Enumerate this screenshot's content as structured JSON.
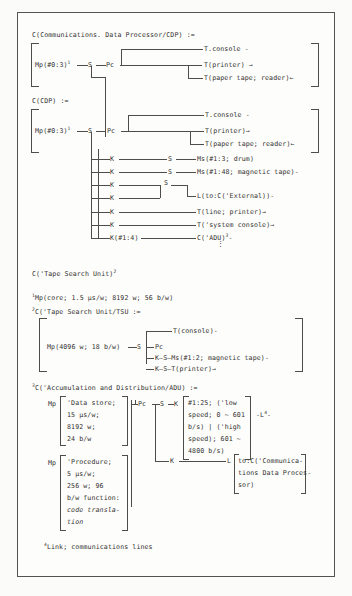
{
  "document": {
    "kind": "pms-notation-diagram",
    "ink_color": "#333130",
    "rule_color": "#4f4d49",
    "frame_color": "#55534e",
    "paper_color": "#fdfdfb"
  },
  "section_cdp": {
    "heading": "C(Communications. Data Processor/CDP) :=",
    "mp": "Mp(#0:3)",
    "mp_sup": "1",
    "s": "S",
    "pc": "Pc",
    "out_console": "T.console -",
    "out_printer": "T(printer) →",
    "out_paper_tape": "T(paper tape; reader)←"
  },
  "section_cdp2": {
    "heading": "C(CDP) :=",
    "mp": "Mp(#0:3)",
    "mp_sup": "1",
    "s": "S",
    "pc": "Pc",
    "out_console": "T.console -",
    "out_printer": "T(printer)→",
    "out_paper_tape": "T(paper tape; reader)←",
    "branches": [
      {
        "k": "K",
        "s": "S",
        "target": "Ms(#1:3; drum)"
      },
      {
        "k": "K",
        "s": "S",
        "target": "Ms(#1:48; magnetic tape)-"
      },
      {
        "k": "K",
        "s": "S",
        "target": ""
      },
      {
        "k": "K",
        "s": "",
        "target": "L(to:C('External))-"
      },
      {
        "k": "K",
        "s": "",
        "target": "T(line; printer)→"
      },
      {
        "k": "K",
        "s": "",
        "target": "T('system console)→"
      }
    ],
    "last_branch": {
      "k": "K(#1:4)",
      "target": "C('ADU)",
      "target_sup": "3"
    },
    "ellipsis": "⋮"
  },
  "tape_search_unit_ref": {
    "text": "C('Tape Search Unit)",
    "sup": "2"
  },
  "footnote1": {
    "marker": "1",
    "text": "Mp(core; 1.5 μs/w; 8192 w; 56 b/w)"
  },
  "footnote2": {
    "marker": "2",
    "heading": "C('Tape Search Unit/TSU :=",
    "mp": "Mp(4096 w; 18 b/w)",
    "s": "S",
    "pc": "Pc",
    "rows": [
      "T(console)-",
      "K—S—Ms(#1:2; magnetic tape)-",
      "K—S—T(printer)→"
    ]
  },
  "footnote3": {
    "marker": "3",
    "heading": "C('Accumulation and Distribution/ADU) :=",
    "mp_label_a": "Mp",
    "data_store_lines": [
      "'Data store;",
      "15 μs/w;",
      "8192 w;",
      "24 b/w"
    ],
    "mp_label_b": "Mp",
    "procedure_lines": [
      "'Procedure;",
      "5 μs/w;",
      "256 w; 96",
      "b/w function:"
    ],
    "procedure_italic_lines": [
      "code transla-",
      "tion"
    ],
    "pc": "Pc",
    "s": "S",
    "k": "K",
    "speed_lines": [
      "#1:25; ('low",
      "speed; 0 ~ 601",
      "b/s) | ('high",
      "speed); 601 ~",
      "4800 b/s)"
    ],
    "link_label": "-L",
    "link_sup": "4",
    "link_tail": "-",
    "k_lower": "K",
    "l_lower": "L",
    "comm_lines": [
      "to:C('Communica-",
      "tions Data Proces-",
      "sor)"
    ]
  },
  "footnote4": {
    "marker": "4",
    "text": "Link; communications lines"
  }
}
